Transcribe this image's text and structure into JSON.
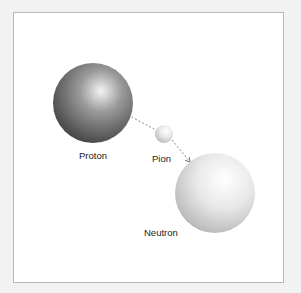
{
  "diagram": {
    "type": "particle-exchange",
    "nodes": [
      {
        "id": "proton",
        "label": "Proton",
        "shade": "dark"
      },
      {
        "id": "pion",
        "label": "Pion",
        "shade": "light"
      },
      {
        "id": "neutron",
        "label": "Neutron",
        "shade": "light"
      }
    ],
    "edges": [
      {
        "from": "proton",
        "to": "pion",
        "style": "dashed"
      },
      {
        "from": "pion",
        "to": "neutron",
        "style": "dashed",
        "arrow": true
      }
    ],
    "colors": {
      "frame_border": "#b8b8b8",
      "background": "#f2f2f2",
      "arrow": "#777777"
    }
  }
}
